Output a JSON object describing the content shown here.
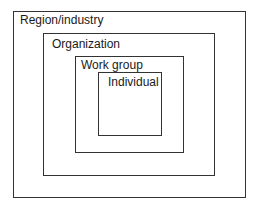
{
  "diagram": {
    "type": "nested-boxes",
    "levels": [
      {
        "id": "region",
        "label": "Region/industry",
        "box": {
          "x": 13,
          "y": 11,
          "w": 233,
          "h": 187
        },
        "label_pos": {
          "x": 20,
          "y": 14
        }
      },
      {
        "id": "organization",
        "label": "Organization",
        "box": {
          "x": 43,
          "y": 33,
          "w": 172,
          "h": 143
        },
        "label_pos": {
          "x": 52,
          "y": 38
        }
      },
      {
        "id": "work-group",
        "label": "Work group",
        "box": {
          "x": 75,
          "y": 56,
          "w": 109,
          "h": 97
        },
        "label_pos": {
          "x": 81,
          "y": 59
        }
      },
      {
        "id": "individual",
        "label": "Individual",
        "box": {
          "x": 98,
          "y": 72,
          "w": 64,
          "h": 64
        },
        "label_pos": {
          "x": 108,
          "y": 76
        }
      }
    ]
  },
  "colors": {
    "stroke": "#333333",
    "background": "#ffffff",
    "text": "#1a1a1a"
  }
}
